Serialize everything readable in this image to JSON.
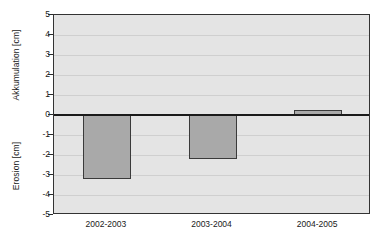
{
  "chart_data": {
    "type": "bar",
    "title": "",
    "subtitle": "",
    "xlabel": "",
    "ylabel_positive": "Akkumulation [cm]",
    "ylabel_negative": "Erosion [cm]",
    "categories": [
      "2002-2003",
      "2003-2004",
      "2004-2005"
    ],
    "values": [
      -3.2,
      -2.2,
      0.25
    ],
    "ylim": [
      -5,
      5
    ],
    "yticks": [
      5,
      4,
      3,
      2,
      1,
      0,
      -1,
      -2,
      -3,
      -4,
      -5
    ],
    "ytick_labels": [
      "5",
      "4",
      "3",
      "2",
      "1",
      "0",
      "-1",
      "-2",
      "-3",
      "-4",
      "-5"
    ],
    "grid": true,
    "legend": null,
    "legend_position": "none",
    "series": [
      {
        "name": "Akkumulation / Erosion",
        "values": [
          -3.2,
          -2.2,
          0.25
        ]
      }
    ],
    "colors": {
      "bar_fill": "#a9a9a9",
      "bar_border": "#3a3a3a",
      "plot_background": "#e4e4e4",
      "gridline": "#cfcfcf",
      "zero_line": "#1a1a1a",
      "frame": "#333333",
      "text": "#1a1a1a",
      "page_background": "#ffffff"
    }
  }
}
